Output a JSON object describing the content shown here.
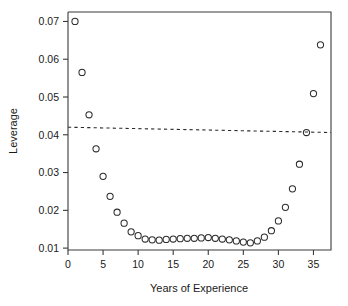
{
  "chart_data": {
    "type": "scatter",
    "title": "",
    "xlabel": "Years of Experience",
    "ylabel": "Leverage",
    "xlim": [
      0,
      37.5
    ],
    "ylim": [
      0.0095,
      0.0725
    ],
    "grid": false,
    "legend": null,
    "xticks": [
      0,
      5,
      10,
      15,
      20,
      25,
      30,
      35
    ],
    "xtick_labels": [
      "0",
      "5",
      "10",
      "15",
      "20",
      "25",
      "30",
      "35"
    ],
    "yticks": [
      0.01,
      0.02,
      0.03,
      0.04,
      0.05,
      0.06,
      0.07
    ],
    "ytick_labels": [
      "0.01",
      "0.02",
      "0.03",
      "0.04",
      "0.05",
      "0.06",
      "0.07"
    ],
    "marker": "open-circle",
    "marker_radius_px": 3.1,
    "point_color": "#2b2b2b",
    "x": [
      1,
      2,
      3,
      4,
      5,
      6,
      7,
      8,
      9,
      10,
      11,
      12,
      13,
      14,
      15,
      16,
      17,
      18,
      19,
      20,
      21,
      22,
      23,
      24,
      25,
      26,
      27,
      28,
      29,
      30,
      31,
      32,
      33,
      34,
      35,
      36
    ],
    "y": [
      0.07,
      0.0565,
      0.0453,
      0.0363,
      0.029,
      0.0237,
      0.0195,
      0.0166,
      0.0143,
      0.0133,
      0.0124,
      0.0122,
      0.0121,
      0.0123,
      0.0124,
      0.0125,
      0.0126,
      0.0126,
      0.0127,
      0.0128,
      0.0126,
      0.0124,
      0.0122,
      0.0119,
      0.0116,
      0.0114,
      0.0119,
      0.0129,
      0.0146,
      0.0172,
      0.0208,
      0.0257,
      0.0322,
      0.0406,
      0.0509,
      0.0638
    ],
    "reference_line": {
      "style": "dashed",
      "color": "#2b2b2b",
      "x": [
        0,
        37.5
      ],
      "y": [
        0.042,
        0.0406
      ],
      "label": ""
    }
  },
  "axes": {
    "x_title": "Years of Experience",
    "y_title": "Leverage"
  }
}
